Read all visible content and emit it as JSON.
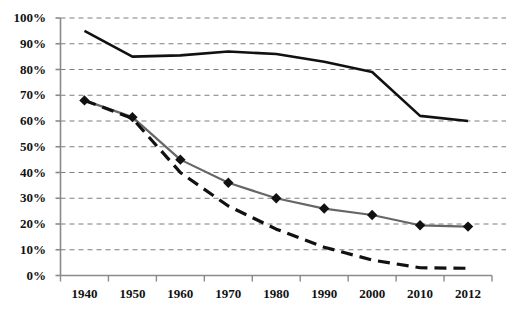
{
  "chart_data": {
    "type": "line",
    "title": "",
    "subtitle": "",
    "xlabel": "",
    "ylabel": "",
    "x": [
      "1940",
      "1950",
      "1960",
      "1970",
      "1980",
      "1990",
      "2000",
      "2010",
      "2012"
    ],
    "categories": [
      "1940",
      "1950",
      "1960",
      "1970",
      "1980",
      "1990",
      "2000",
      "2010",
      "2012"
    ],
    "ylim": [
      0,
      100
    ],
    "yticks": [
      0,
      10,
      20,
      30,
      40,
      50,
      60,
      70,
      80,
      90,
      100
    ],
    "ytick_labels": [
      "0%",
      "10%",
      "20%",
      "30%",
      "40%",
      "50%",
      "60%",
      "70%",
      "80%",
      "90%",
      "100%"
    ],
    "xtick_labels": [
      "1940",
      "1950",
      "1960",
      "1970",
      "1980",
      "1990",
      "2000",
      "2010",
      "2012"
    ],
    "grid": "horizontal-dashed",
    "legend": "none",
    "series": [
      {
        "name": "solid-black-line",
        "style": "solid",
        "color": "#111111",
        "width": 2.6,
        "marker": "none",
        "values": [
          95,
          85,
          85.5,
          87,
          86,
          83,
          79,
          62,
          60
        ]
      },
      {
        "name": "gray-line-with-diamond-markers",
        "style": "solid",
        "color": "#666666",
        "width": 2.2,
        "marker": "diamond",
        "marker_color": "#111111",
        "values": [
          68,
          61.5,
          45,
          36,
          30,
          26,
          23.5,
          19.5,
          19
        ]
      },
      {
        "name": "dashed-black-line",
        "style": "dashed",
        "color": "#111111",
        "width": 3.2,
        "marker": "none",
        "values": [
          68,
          61,
          40,
          27,
          18,
          11,
          6,
          3,
          2.8
        ]
      }
    ]
  },
  "axis": {
    "y_axis_name": "percent-axis",
    "x_axis_name": "year-axis"
  }
}
